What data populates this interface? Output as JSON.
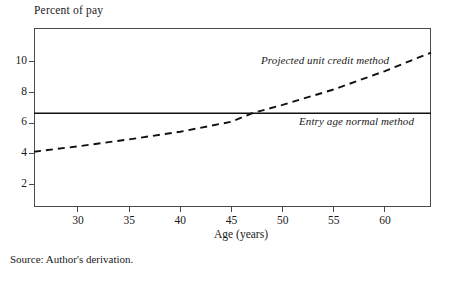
{
  "chart_data": {
    "type": "line",
    "title": "",
    "ylabel": "Percent of pay",
    "xlabel": "Age (years)",
    "xlim": [
      25.7,
      64.5
    ],
    "ylim": [
      0.55,
      12.2
    ],
    "grid": false,
    "legend_position": "inline-annotations",
    "x_ticks": [
      30,
      35,
      40,
      45,
      50,
      55,
      60
    ],
    "x_tick_labels": [
      "30",
      "35",
      "40",
      "45",
      "50",
      "55",
      "60"
    ],
    "y_ticks": [
      2,
      4,
      6,
      8,
      10
    ],
    "y_tick_labels": [
      "2",
      "4",
      "6",
      "8",
      "10"
    ],
    "series": [
      {
        "name": "Projected unit credit method",
        "style": "dashed",
        "x": [
          25.7,
          30,
          35,
          40,
          45,
          47,
          50,
          55,
          60,
          64.5
        ],
        "values": [
          4.15,
          4.5,
          4.95,
          5.45,
          6.1,
          6.65,
          7.2,
          8.2,
          9.4,
          10.6
        ]
      },
      {
        "name": "Entry age normal method",
        "style": "solid",
        "x": [
          25.7,
          64.5
        ],
        "values": [
          6.65,
          6.65
        ]
      }
    ],
    "annotations": [
      {
        "text": "Projected unit credit method",
        "x": 47.5,
        "y": 10.9
      },
      {
        "text": "Entry age normal method",
        "x": 51.5,
        "y": 6.0
      }
    ],
    "crossing_age": 47,
    "source_note": "Source: Author's derivation."
  },
  "colors": {
    "axis": "#4a4a4a",
    "line": "#111111",
    "text": "#1a1a1a",
    "background": "#ffffff"
  }
}
